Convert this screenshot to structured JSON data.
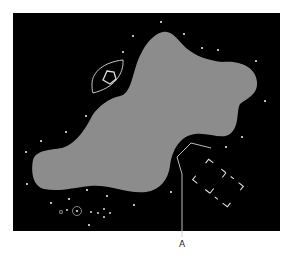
{
  "diagram": {
    "background": "#ffffff",
    "frame": {
      "x": 13,
      "y": 13,
      "width": 267,
      "height": 218,
      "fill": "#000000"
    },
    "blob": {
      "fill": "#8c8c8c"
    },
    "star_color": "#e8e8e8",
    "stars": [
      [
        161,
        22
      ],
      [
        133,
        36
      ],
      [
        184,
        34
      ],
      [
        123,
        52
      ],
      [
        202,
        48
      ],
      [
        218,
        50
      ],
      [
        256,
        61
      ],
      [
        265,
        101
      ],
      [
        242,
        137
      ],
      [
        226,
        147
      ],
      [
        86,
        116
      ],
      [
        66,
        132
      ],
      [
        41,
        141
      ],
      [
        26,
        152
      ],
      [
        27,
        184
      ],
      [
        51,
        203
      ],
      [
        69,
        199
      ],
      [
        87,
        190
      ],
      [
        107,
        196
      ],
      [
        134,
        205
      ],
      [
        171,
        192
      ],
      [
        89,
        225
      ]
    ],
    "eye_shape": {
      "cx": 108,
      "cy": 75,
      "pentagon": true
    },
    "cluster": {
      "circled_star": [
        77,
        211
      ],
      "small_squares": [
        [
          61,
          212
        ],
        [
          67,
          210
        ]
      ],
      "cross_stars": [
        [
          104,
          209
        ],
        [
          98,
          213
        ],
        [
          110,
          213
        ],
        [
          104,
          217
        ],
        [
          91,
          212
        ]
      ]
    },
    "pointer_line": {
      "points": [
        [
          211,
          148
        ],
        [
          191,
          143
        ],
        [
          177,
          157
        ],
        [
          182,
          174
        ],
        [
          182,
          237
        ]
      ]
    },
    "dashed_rect": {
      "cx": 218,
      "cy": 183,
      "w": 44,
      "h": 26,
      "angle": 38
    },
    "label": {
      "text": "A",
      "x": 179,
      "y": 239
    }
  }
}
